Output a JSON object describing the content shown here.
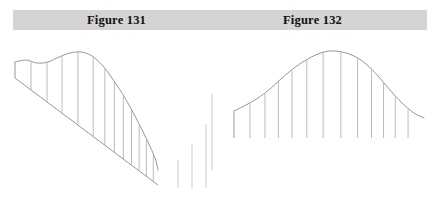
{
  "page": {
    "background_color": "#ffffff",
    "width": 444,
    "height": 210
  },
  "caption_band": {
    "background_color": "#d4d4d4",
    "left_caption": "Figure 131",
    "right_caption": "Figure 132"
  },
  "chart_data": [
    {
      "id": "figure-131",
      "type": "area",
      "title": "Figure 131",
      "xlabel": "",
      "ylabel": "",
      "description": "Skewed frequency curve drawn on an inclined (sloping) base line, with vertical ordinates dropped from the curve to the slanted base.",
      "grid": false,
      "legend": false,
      "curve_color": "#8a8a8a",
      "ordinate_color": "#b0b0b0",
      "baseline_color": "#8a8a8a",
      "baseline_slanted": true,
      "baseline_start": [
        15,
        78
      ],
      "baseline_end": [
        158,
        185
      ],
      "ordinate_count": 13,
      "x": [
        0,
        1,
        2,
        3,
        4,
        5,
        6,
        7,
        8,
        9,
        10,
        11,
        12
      ],
      "values": [
        16,
        17,
        22,
        29,
        34,
        36,
        34,
        28,
        21,
        15,
        11,
        9,
        8
      ],
      "ylim": [
        0,
        40
      ],
      "curve_points": [
        [
          15,
          62
        ],
        [
          26,
          60
        ],
        [
          37,
          63
        ],
        [
          48,
          62
        ],
        [
          59,
          57
        ],
        [
          70,
          53
        ],
        [
          81,
          52
        ],
        [
          92,
          56
        ],
        [
          103,
          66
        ],
        [
          114,
          81
        ],
        [
          125,
          98
        ],
        [
          136,
          118
        ],
        [
          147,
          140
        ],
        [
          155,
          158
        ],
        [
          158,
          170
        ]
      ]
    },
    {
      "id": "figure-132",
      "type": "area",
      "title": "Figure 132",
      "xlabel": "",
      "ylabel": "",
      "description": "Symmetrical normal (bell-shaped) frequency curve drawn on a horizontal base line, with vertical ordinates dropped from the curve to the base.",
      "grid": false,
      "legend": false,
      "curve_color": "#8a8a8a",
      "ordinate_color": "#b0b0b0",
      "baseline_color": "#ffffff",
      "baseline_slanted": false,
      "baseline_y": 138,
      "baseline_start": [
        232,
        138
      ],
      "baseline_end": [
        424,
        138
      ],
      "ordinate_count": 13,
      "x": [
        0,
        1,
        2,
        3,
        4,
        5,
        6,
        7,
        8,
        9,
        10,
        11,
        12
      ],
      "values": [
        27,
        36,
        49,
        62,
        75,
        84,
        87,
        84,
        75,
        62,
        49,
        36,
        27
      ],
      "ylim": [
        0,
        90
      ],
      "curve_points": [
        [
          234,
          111
        ],
        [
          246,
          105
        ],
        [
          258,
          98
        ],
        [
          270,
          89
        ],
        [
          282,
          78
        ],
        [
          294,
          68
        ],
        [
          306,
          60
        ],
        [
          318,
          54
        ],
        [
          330,
          51
        ],
        [
          342,
          52
        ],
        [
          354,
          56
        ],
        [
          366,
          64
        ],
        [
          378,
          76
        ],
        [
          390,
          90
        ],
        [
          402,
          103
        ],
        [
          414,
          113
        ],
        [
          424,
          118
        ]
      ]
    }
  ],
  "detached_ordinates": {
    "description": "Three isolated vertical ordinate lines between the two figures",
    "color": "#c2c2c2",
    "lines": [
      {
        "x": 178,
        "y_top": 160,
        "y_bottom": 188,
        "height": 28
      },
      {
        "x": 192,
        "y_top": 144,
        "y_bottom": 188,
        "height": 44
      },
      {
        "x": 206,
        "y_top": 124,
        "y_bottom": 188,
        "height": 64
      },
      {
        "x": 212,
        "y_top": 94,
        "y_bottom": 170,
        "height": 76
      }
    ]
  }
}
